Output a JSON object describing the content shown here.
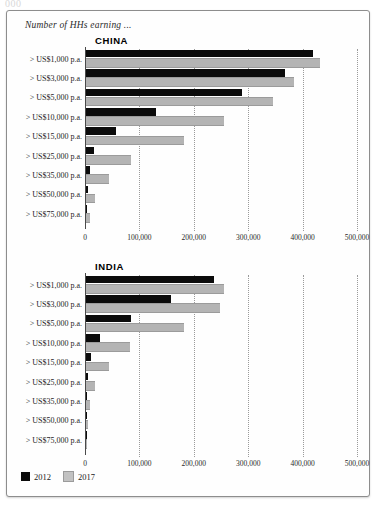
{
  "top_artifact": "000",
  "figure": {
    "title": "Number of HHs earning ..."
  },
  "legend": {
    "items": [
      {
        "label": "2012",
        "color": "#0b0b0b"
      },
      {
        "label": "2017",
        "color": "#c2c2c2"
      }
    ]
  },
  "chart_data": [
    {
      "type": "bar",
      "title": "CHINA",
      "orientation": "horizontal",
      "xlabel": "",
      "ylabel": "",
      "xlim": [
        0,
        500000
      ],
      "grid": true,
      "legend_position": "bottom-left",
      "tick_labels": [
        "0",
        "100,000",
        "200,000",
        "300,000",
        "400,000",
        "500,000"
      ],
      "ticks": [
        0,
        100000,
        200000,
        300000,
        400000,
        500000
      ],
      "categories": [
        "> US$1,000 p.a.",
        "> US$3,000 p.a.",
        "> US$5,000 p.a.",
        "> US$10,000 p.a.",
        "> US$15,000 p.a.",
        "> US$25,000 p.a.",
        "> US$35,000 p.a.",
        "> US$50,000 p.a.",
        "> US$75,000 p.a."
      ],
      "series": [
        {
          "name": "2012",
          "color": "#0b0b0b",
          "values": [
            418000,
            366000,
            287000,
            128000,
            55000,
            15000,
            8000,
            4000,
            2000
          ]
        },
        {
          "name": "2017",
          "color": "#c2c2c2",
          "values": [
            430000,
            383000,
            343000,
            253000,
            181000,
            83000,
            43000,
            17000,
            8000
          ]
        }
      ]
    },
    {
      "type": "bar",
      "title": "INDIA",
      "orientation": "horizontal",
      "xlabel": "",
      "ylabel": "",
      "xlim": [
        0,
        500000
      ],
      "grid": true,
      "legend_position": "bottom-left",
      "tick_labels": [
        "0",
        "100,000",
        "200,000",
        "300,000",
        "400,000",
        "500,000"
      ],
      "ticks": [
        0,
        100000,
        200000,
        300000,
        400000,
        500000
      ],
      "categories": [
        "> US$1,000 p.a.",
        "> US$3,000 p.a.",
        "> US$5,000 p.a.",
        "> US$10,000 p.a.",
        "> US$15,000 p.a.",
        "> US$25,000 p.a.",
        "> US$35,000 p.a.",
        "> US$50,000 p.a.",
        "> US$75,000 p.a."
      ],
      "series": [
        {
          "name": "2012",
          "color": "#0b0b0b",
          "values": [
            236000,
            157000,
            83000,
            25000,
            9000,
            4000,
            2000,
            1000,
            500
          ]
        },
        {
          "name": "2017",
          "color": "#c2c2c2",
          "values": [
            253000,
            247000,
            181000,
            81000,
            42000,
            17000,
            8000,
            4000,
            2000
          ]
        }
      ]
    }
  ]
}
